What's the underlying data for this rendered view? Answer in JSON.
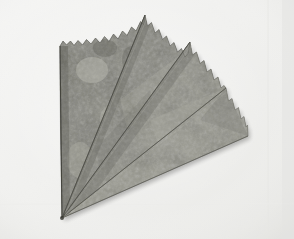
{
  "image": {
    "kind": "natural-photograph",
    "subject": "folded fan of leaf blades",
    "caption": "Four overlapping triangular leaf blades fanned out from a single apex at the lower left, each with a scalloped upper edge, photographed on a plain light background.",
    "width": 294,
    "height": 239,
    "orientation": "landscape"
  },
  "background": {
    "name": "studio-backdrop",
    "base_color": "#f1f1ef",
    "top_left_color": "#f6f6f5",
    "bottom_left_color": "#efefed",
    "bottom_right_color": "#e9e9e7",
    "right_edge_shadow_color": "#e3e3e1",
    "vignette_color": "#e6e6e3"
  },
  "subject_colors": {
    "mid_tone": "#8d8d86",
    "light_mottle": "#b9b9b0",
    "dark_mottle": "#5e5e58",
    "deep_shadow": "#3d3d39",
    "fold_line": "#4a4a45",
    "edge_outline": "#6a6a63",
    "highlight": "#cdcdc4"
  },
  "geometry": {
    "apex": {
      "x": 62,
      "y": 218,
      "label": "common-apex"
    },
    "blades": [
      {
        "id": "blade-1",
        "label": "leftmost blade",
        "tip": {
          "x": 145,
          "y": 15
        },
        "inner_corner": {
          "x": 60,
          "y": 44
        },
        "scallop_count": 7,
        "tone": "#8a8a83"
      },
      {
        "id": "blade-2",
        "label": "second blade",
        "tip": {
          "x": 190,
          "y": 42
        },
        "inner_corner": {
          "x": 145,
          "y": 15
        },
        "scallop_count": 6,
        "tone": "#8f8f88"
      },
      {
        "id": "blade-3",
        "label": "third blade",
        "tip": {
          "x": 226,
          "y": 88
        },
        "inner_corner": {
          "x": 190,
          "y": 42
        },
        "scallop_count": 6,
        "tone": "#94948c"
      },
      {
        "id": "blade-4",
        "label": "rightmost blade",
        "tip": {
          "x": 248,
          "y": 136
        },
        "inner_corner": {
          "x": 226,
          "y": 88
        },
        "scallop_count": 6,
        "tone": "#9a9a92"
      }
    ],
    "fold_lines": [
      {
        "id": "fold-1",
        "from": "apex",
        "to": {
          "x": 145,
          "y": 15
        }
      },
      {
        "id": "fold-2",
        "from": "apex",
        "to": {
          "x": 190,
          "y": 42
        }
      },
      {
        "id": "fold-3",
        "from": "apex",
        "to": {
          "x": 226,
          "y": 88
        }
      }
    ],
    "left_edge": {
      "from": {
        "x": 60,
        "y": 44
      },
      "to": {
        "x": 62,
        "y": 218
      }
    },
    "bottom_edge": {
      "from": {
        "x": 62,
        "y": 218
      },
      "to": {
        "x": 248,
        "y": 136
      }
    }
  }
}
